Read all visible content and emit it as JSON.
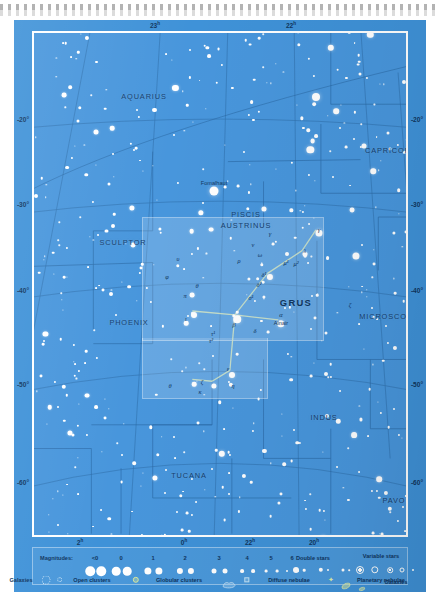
{
  "chart_data": {
    "type": "scatter",
    "subtitle": "Equatorial star map centred on the constellation Grus",
    "xlabel": "Right Ascension",
    "ylabel": "Declination",
    "projection": "conic",
    "grid": true,
    "legend_position": "bottom",
    "ra_range_h": [
      20,
      2
    ],
    "dec_range_deg": [
      -65,
      -15
    ],
    "ra_ticks_top": [
      {
        "label": "23",
        "unit": "h",
        "x": 141
      },
      {
        "label": "22",
        "unit": "h",
        "x": 277
      }
    ],
    "ra_ticks_bottom": [
      {
        "label": "2",
        "unit": "h",
        "x": 66
      },
      {
        "label": "0",
        "unit": "h",
        "x": 170
      },
      {
        "label": "22",
        "unit": "h",
        "x": 236
      },
      {
        "label": "20",
        "unit": "h",
        "x": 300
      }
    ],
    "dec_ticks_left": [
      {
        "label": "-20°",
        "y": 99
      },
      {
        "label": "-30°",
        "y": 184
      },
      {
        "label": "-40°",
        "y": 270
      },
      {
        "label": "-50°",
        "y": 364
      },
      {
        "label": "-60°",
        "y": 462
      }
    ],
    "dec_ticks_right": [
      {
        "label": "-20°",
        "y": 99
      },
      {
        "label": "-30°",
        "y": 184
      },
      {
        "label": "-40°",
        "y": 270
      },
      {
        "label": "-50°",
        "y": 364
      },
      {
        "label": "-60°",
        "y": 462
      }
    ],
    "constellation_labels": [
      {
        "name": "AQUARIUS",
        "x": 110,
        "y": 63,
        "size": "normal"
      },
      {
        "name": "CAPRICORNUS",
        "x": 363,
        "y": 117,
        "size": "normal"
      },
      {
        "name": "PISCIS",
        "x": 212,
        "y": 181,
        "size": "normal"
      },
      {
        "name": "AUSTRINUS",
        "x": 212,
        "y": 192,
        "size": "normal"
      },
      {
        "name": "SCULPTOR",
        "x": 89,
        "y": 209,
        "size": "normal"
      },
      {
        "name": "PHOENIX",
        "x": 95,
        "y": 289,
        "size": "normal"
      },
      {
        "name": "GRUS",
        "x": 262,
        "y": 269,
        "size": "big"
      },
      {
        "name": "MICROSCOPIUM",
        "x": 360,
        "y": 283,
        "size": "normal"
      },
      {
        "name": "INDUS",
        "x": 290,
        "y": 384,
        "size": "normal"
      },
      {
        "name": "TEL",
        "x": 386,
        "y": 395,
        "size": "normal"
      },
      {
        "name": "TUCANA",
        "x": 155,
        "y": 442,
        "size": "normal"
      },
      {
        "name": "PAVO",
        "x": 360,
        "y": 467,
        "size": "normal"
      },
      {
        "name": "HYDRUS",
        "x": 58,
        "y": 510,
        "size": "normal"
      },
      {
        "name": "OCTANS",
        "x": 214,
        "y": 530,
        "size": "normal"
      }
    ],
    "named_stars": [
      {
        "name": "Fomalhaut",
        "x": 180,
        "y": 150
      },
      {
        "name": "Alnair",
        "x": 247,
        "y": 290
      }
    ],
    "greek_labels": [
      {
        "text": "γ",
        "x": 236,
        "y": 200
      },
      {
        "text": "γ",
        "x": 285,
        "y": 196
      },
      {
        "text": "λ",
        "x": 271,
        "y": 217
      },
      {
        "text": "ν",
        "x": 219,
        "y": 211
      },
      {
        "text": "μ¹",
        "x": 252,
        "y": 229
      },
      {
        "text": "μ²",
        "x": 262,
        "y": 230
      },
      {
        "text": "ρ",
        "x": 205,
        "y": 227
      },
      {
        "text": "ω",
        "x": 226,
        "y": 221
      },
      {
        "text": "δ¹",
        "x": 230,
        "y": 241
      },
      {
        "text": "δ²",
        "x": 225,
        "y": 251
      },
      {
        "text": "υ",
        "x": 144,
        "y": 225
      },
      {
        "text": "φ",
        "x": 133,
        "y": 243
      },
      {
        "text": "θ",
        "x": 163,
        "y": 252
      },
      {
        "text": "π",
        "x": 151,
        "y": 262
      },
      {
        "text": "ι",
        "x": 152,
        "y": 285
      },
      {
        "text": "β",
        "x": 200,
        "y": 291
      },
      {
        "text": "α",
        "x": 247,
        "y": 281
      },
      {
        "text": "σ¹",
        "x": 217,
        "y": 264
      },
      {
        "text": "δ",
        "x": 221,
        "y": 297
      },
      {
        "text": "τ¹",
        "x": 179,
        "y": 300
      },
      {
        "text": "τ²",
        "x": 177,
        "y": 307
      },
      {
        "text": "ε",
        "x": 194,
        "y": 335
      },
      {
        "text": "ζ",
        "x": 168,
        "y": 348
      },
      {
        "text": "κ",
        "x": 166,
        "y": 358
      },
      {
        "text": "η",
        "x": 199,
        "y": 352
      },
      {
        "text": "θ",
        "x": 136,
        "y": 352
      },
      {
        "text": "ζ",
        "x": 316,
        "y": 271
      }
    ],
    "constellation_lines": [
      [
        [
          285,
          199
        ],
        [
          271,
          220
        ]
      ],
      [
        [
          271,
          220
        ],
        [
          236,
          243
        ]
      ],
      [
        [
          236,
          243
        ],
        [
          203,
          285
        ]
      ],
      [
        [
          203,
          285
        ],
        [
          247,
          290
        ]
      ],
      [
        [
          203,
          285
        ],
        [
          160,
          281
        ]
      ],
      [
        [
          203,
          285
        ],
        [
          198,
          341
        ]
      ],
      [
        [
          198,
          341
        ],
        [
          180,
          352
        ]
      ],
      [
        [
          180,
          352
        ],
        [
          160,
          350
        ]
      ]
    ]
  },
  "legend": {
    "magnitudes_label": "Magnitudes:",
    "magnitude_values": [
      "<0",
      "0",
      "1",
      "2",
      "3",
      "4",
      "5",
      "6"
    ],
    "double_stars_label": "Double stars",
    "variable_stars_label": "Variable stars",
    "open_clusters_label": "Open clusters",
    "globular_clusters_label": "Globular clusters",
    "diffuse_nebulae_label": "Diffuse nebulae",
    "planetary_nebulae_label": "Planetary nebulae",
    "galaxies_label": "Galaxies"
  },
  "colors": {
    "sky": "#4896dc",
    "plate": "#3f92d8",
    "star": "#ffffff",
    "grid": "#2f6fab",
    "label": "#10365f",
    "frame": "#ffffff",
    "constellation_line": "#cfe4c8",
    "region_highlight": "rgba(255,255,255,0.17)"
  }
}
